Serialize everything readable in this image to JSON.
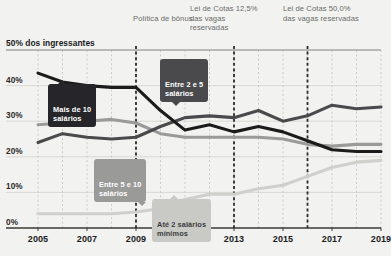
{
  "headline": "50% dos ingressantes",
  "annotations": [
    {
      "id": "bonus",
      "text": "Política\nde bônus",
      "year": 2009
    },
    {
      "id": "cotas125",
      "text": "Lei de Cotas\n12,5% das vagas\nreservadas",
      "year": 2013
    },
    {
      "id": "cotas50",
      "text": "Lei de Cotas\n50,0% das vagas\nreservadas",
      "year": 2016
    }
  ],
  "callouts": {
    "mais10": "Mais de 10\nsalários",
    "entre25": "Entre 2 e 5\nsalários",
    "entre510": "Entre 5 e 10\nsalários",
    "ate2": "Até 2 salários\nmínimos"
  },
  "colors": {
    "mais10": "#1b1b1b",
    "entre25": "#4a4a4d",
    "entre510": "#9a9a99",
    "ate2": "#cfcfcb",
    "grid": "#d8d8d4",
    "eventline": "#2b2b2b",
    "background": "#f2f2f0",
    "axis": "#3c3c3a"
  },
  "chart_data": {
    "type": "line",
    "title": "50% dos ingressantes",
    "xlabel": "",
    "ylabel": "",
    "xlim": [
      2005,
      2019
    ],
    "ylim": [
      0,
      50
    ],
    "yticks": [
      0,
      10,
      20,
      30,
      40,
      50
    ],
    "ytick_labels": [
      "0%",
      "10%",
      "20%",
      "30%",
      "40%",
      "50%"
    ],
    "xticks": [
      2005,
      2007,
      2009,
      2011,
      2013,
      2015,
      2017,
      2019
    ],
    "xtick_labels": [
      "2005",
      "2007",
      "2009",
      "2011",
      "2013",
      "2015",
      "2017",
      "2019"
    ],
    "x": [
      2005,
      2006,
      2007,
      2008,
      2009,
      2010,
      2011,
      2012,
      2013,
      2014,
      2015,
      2016,
      2017,
      2018,
      2019
    ],
    "grid": true,
    "legend": "inline-callouts",
    "series": [
      {
        "name": "Mais de 10 salários",
        "color": "#1b1b1b",
        "values": [
          43.5,
          41.0,
          40.0,
          39.5,
          39.5,
          33.0,
          27.5,
          29.0,
          27.0,
          28.5,
          27.0,
          24.5,
          22.0,
          21.5,
          21.5
        ]
      },
      {
        "name": "Entre 2 e 5 salários",
        "color": "#4a4a4d",
        "values": [
          24.0,
          26.5,
          25.5,
          25.0,
          25.5,
          28.5,
          31.0,
          31.5,
          31.0,
          33.0,
          30.0,
          31.5,
          34.5,
          33.5,
          34.0
        ]
      },
      {
        "name": "Entre 5 e 10 salários",
        "color": "#9a9a99",
        "values": [
          29.0,
          29.5,
          30.0,
          30.5,
          29.5,
          26.5,
          25.5,
          25.5,
          25.5,
          25.5,
          25.0,
          23.5,
          23.0,
          23.5,
          23.5
        ]
      },
      {
        "name": "Até 2 salários mínimos",
        "color": "#cfcfcb",
        "values": [
          4.0,
          4.0,
          4.0,
          4.0,
          4.5,
          5.5,
          8.0,
          9.5,
          9.5,
          11.0,
          12.0,
          14.5,
          17.0,
          18.5,
          19.0
        ]
      }
    ],
    "event_markers": [
      {
        "year": 2009,
        "label": "Política de bônus"
      },
      {
        "year": 2013,
        "label": "Lei de Cotas 12,5% das vagas reservadas"
      },
      {
        "year": 2016,
        "label": "Lei de Cotas 50,0% das vagas reservadas"
      }
    ]
  }
}
